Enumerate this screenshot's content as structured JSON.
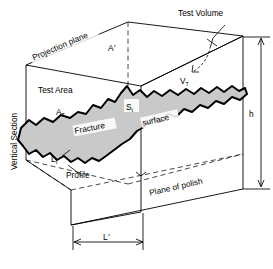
{
  "figure": {
    "labels": {
      "projection_plane": "Projection plane",
      "projected_area": "A",
      "projected_area_prime": "′",
      "test_volume": "Test Volume",
      "test_volume_symbol": "V",
      "test_volume_subscript": "T",
      "test_area": "Test Area",
      "test_area_symbol": "A",
      "test_area_subscript": "T",
      "surface_symbol": "S",
      "surface_subscript": "t",
      "fracture": "Fracture",
      "surface": "surface",
      "profile_length_symbol": "L",
      "profile_length_subscript": "t",
      "profile": "Profile",
      "plane_of_polish": "Plane of polish",
      "vertical_section": "Vertical Section",
      "height_dim": "h",
      "length_dim": "L",
      "length_dim_prime": "′"
    },
    "colors": {
      "fracture_fill": "#c9c9c9",
      "line": "#000000",
      "background": "#ffffff"
    }
  }
}
